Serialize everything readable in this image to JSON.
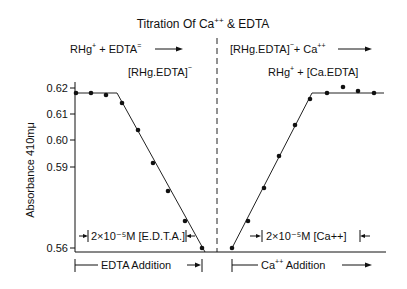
{
  "title": "Titration Of Ca++ & EDTA",
  "title_parts": {
    "pre": "Titration  Of  Ca",
    "sup": "++",
    "post": " &  EDTA"
  },
  "reactions": {
    "left_line1": "RHg+ + EDTA= →",
    "left_line2": "[RHg.EDTA]−",
    "right_line1": "[RHg.EDTA]− + Ca++ →",
    "right_line2": "RHg+ + [Ca.EDTA]"
  },
  "annotations": {
    "left_interval": "2×10⁻⁵M [E.D.T.A.]",
    "right_interval": "2×10⁻⁵M [Ca++]",
    "left_axis_label": "EDTA Addition",
    "right_axis_label": "Ca++ Addition"
  },
  "chart_data": {
    "type": "line",
    "title": "Titration Of Ca++ & EDTA",
    "ylabel": "Absorbance 410mμ",
    "xlabel": "",
    "yticks": [
      "0.62",
      "0.61",
      "0.60",
      "0.59",
      "0.56"
    ],
    "ylim": [
      0.56,
      0.622
    ],
    "grid": false,
    "series": [
      {
        "name": "EDTA Addition (RHg+ + EDTA= → [RHg.EDTA]-)",
        "x": [
          0,
          1,
          2,
          3,
          4,
          5,
          6,
          7,
          8
        ],
        "values": [
          0.618,
          0.618,
          0.617,
          0.614,
          0.604,
          0.591,
          0.581,
          0.569,
          0.56
        ],
        "fit_line": [
          [
            0,
            0.618
          ],
          [
            2.9,
            0.618
          ],
          [
            8.2,
            0.56
          ]
        ]
      },
      {
        "name": "Ca++ Addition ([RHg.EDTA]- + Ca++ → RHg+ + [Ca.EDTA])",
        "x": [
          0,
          1,
          2,
          3,
          4,
          5,
          6,
          7,
          8,
          9
        ],
        "values": [
          0.56,
          0.57,
          0.582,
          0.594,
          0.605,
          0.615,
          0.618,
          0.62,
          0.618,
          0.618
        ],
        "fit_line": [
          [
            0,
            0.56
          ],
          [
            5.4,
            0.618
          ],
          [
            9.4,
            0.618
          ]
        ]
      }
    ],
    "annotations": [
      "2×10⁻⁵M [E.D.T.A.]",
      "2×10⁻⁵M [Ca++]",
      "EDTA Addition",
      "Ca++ Addition"
    ]
  },
  "plot": {
    "y_ticks": [
      {
        "label": "0.62",
        "y": 88
      },
      {
        "label": "0.61",
        "y": 114
      },
      {
        "label": "0.60",
        "y": 140
      },
      {
        "label": "0.59",
        "y": 167
      },
      {
        "label": "0.56",
        "y": 248
      }
    ],
    "left_points": [
      [
        76,
        93
      ],
      [
        91,
        93
      ],
      [
        106,
        95
      ],
      [
        122,
        103
      ],
      [
        138,
        130
      ],
      [
        153,
        163
      ],
      [
        168,
        191
      ],
      [
        185,
        221
      ],
      [
        202,
        248
      ]
    ],
    "right_points": [
      [
        232,
        248
      ],
      [
        248,
        221
      ],
      [
        264,
        188
      ],
      [
        279,
        156
      ],
      [
        295,
        125
      ],
      [
        310,
        99
      ],
      [
        327,
        93
      ],
      [
        343,
        87
      ],
      [
        358,
        91
      ],
      [
        374,
        93
      ]
    ],
    "left_fit": "75,93 117,93 205,252",
    "right_fit": "231,250 312,93 384,93"
  }
}
